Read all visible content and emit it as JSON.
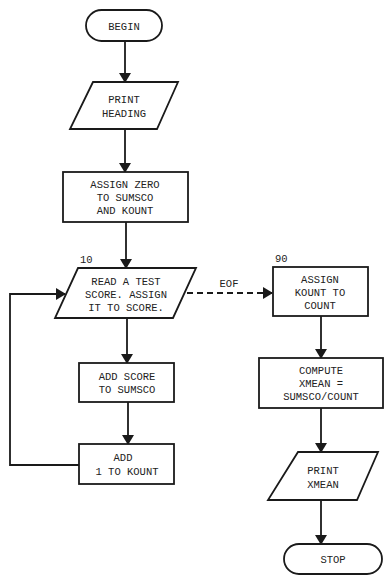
{
  "flowchart": {
    "colors": {
      "stroke": "#1a1a1a",
      "text": "#222222",
      "background": "#ffffff"
    },
    "nodes": {
      "begin": {
        "type": "terminal",
        "lines": [
          "BEGIN"
        ]
      },
      "print_heading": {
        "type": "io",
        "lines": [
          "PRINT",
          "HEADING"
        ]
      },
      "assign_zero": {
        "type": "process",
        "lines": [
          "ASSIGN ZERO",
          "TO SUMSCO",
          "AND KOUNT"
        ]
      },
      "read_score": {
        "type": "io",
        "label": "10",
        "lines": [
          "READ A TEST",
          "SCORE. ASSIGN",
          "IT TO SCORE."
        ]
      },
      "add_score": {
        "type": "process",
        "lines": [
          "ADD SCORE",
          "TO SUMSCO"
        ]
      },
      "add_kount": {
        "type": "process",
        "lines": [
          "ADD",
          "1 TO KOUNT"
        ]
      },
      "assign_kount": {
        "type": "process",
        "label": "90",
        "lines": [
          "ASSIGN",
          "KOUNT TO",
          "COUNT"
        ]
      },
      "compute_xmean": {
        "type": "process",
        "lines": [
          "COMPUTE",
          "XMEAN =",
          "SUMSCO/COUNT"
        ]
      },
      "print_xmean": {
        "type": "io",
        "lines": [
          "PRINT",
          "XMEAN"
        ]
      },
      "stop": {
        "type": "terminal",
        "lines": [
          "STOP"
        ]
      }
    },
    "edges": {
      "eof_label": "EOF"
    }
  }
}
